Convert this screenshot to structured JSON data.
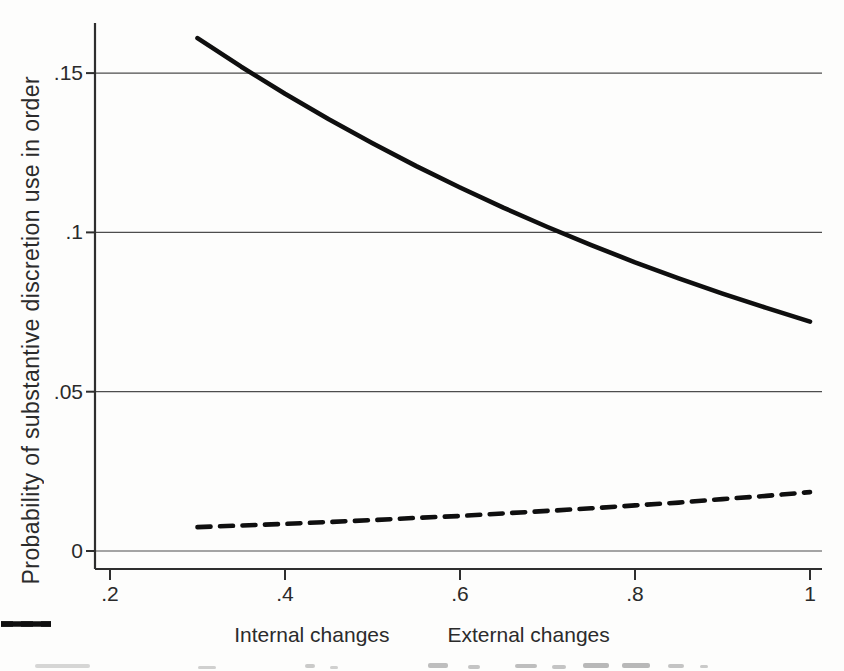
{
  "figure": {
    "y_axis_title": "Probability of substantive discretion use in order"
  },
  "chart_data": {
    "type": "line",
    "title": "",
    "xlabel": "",
    "ylabel": "Probability of substantive discretion use in order",
    "xlim": [
      0.2,
      1.0
    ],
    "ylim": [
      0,
      0.165
    ],
    "grid": "horizontal",
    "legend_position": "bottom",
    "x_ticks": [
      ".2",
      ".4",
      ".6",
      ".8",
      "1"
    ],
    "x_tick_values": [
      0.2,
      0.4,
      0.6,
      0.8,
      1.0
    ],
    "y_ticks": [
      "0",
      ".05",
      ".1",
      ".15"
    ],
    "y_tick_values": [
      0,
      0.05,
      0.1,
      0.15
    ],
    "series": [
      {
        "name": "Internal changes",
        "style": "dashed",
        "x": [
          0.3,
          0.35,
          0.4,
          0.45,
          0.5,
          0.55,
          0.6,
          0.65,
          0.7,
          0.75,
          0.8,
          0.85,
          0.9,
          0.95,
          1.0
        ],
        "y": [
          0.0075,
          0.008,
          0.0085,
          0.0091,
          0.0097,
          0.0104,
          0.011,
          0.0118,
          0.0126,
          0.0134,
          0.0143,
          0.0152,
          0.0163,
          0.0173,
          0.0185
        ]
      },
      {
        "name": "External changes",
        "style": "solid",
        "x": [
          0.3,
          0.35,
          0.4,
          0.45,
          0.5,
          0.55,
          0.6,
          0.65,
          0.7,
          0.75,
          0.8,
          0.85,
          0.9,
          0.95,
          1.0
        ],
        "y": [
          0.161,
          0.152,
          0.1435,
          0.1355,
          0.128,
          0.1208,
          0.1141,
          0.1077,
          0.1017,
          0.096,
          0.0906,
          0.0856,
          0.0808,
          0.0763,
          0.072
        ]
      }
    ]
  }
}
